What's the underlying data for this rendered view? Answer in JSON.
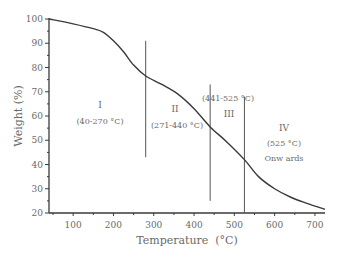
{
  "chart_data": {
    "type": "line",
    "title": "",
    "xlabel": "Temperature  (°C)",
    "ylabel": "Weight (%)",
    "xlim": [
      40,
      725
    ],
    "ylim": [
      20,
      100
    ],
    "xticks": [
      100,
      200,
      300,
      400,
      500,
      600,
      700
    ],
    "yticks": [
      20,
      30,
      40,
      50,
      60,
      70,
      80,
      90,
      100
    ],
    "grid": false,
    "legend": null,
    "series": [
      {
        "name": "TGA curve",
        "x": [
          40,
          100,
          150,
          175,
          200,
          225,
          250,
          280,
          320,
          360,
          400,
          440,
          480,
          525,
          560,
          600,
          640,
          680,
          725
        ],
        "y": [
          100,
          98,
          96,
          94.5,
          91,
          86.5,
          81,
          76.5,
          73,
          69,
          63,
          55.5,
          49.5,
          42,
          35,
          30,
          26.5,
          24,
          21.5
        ]
      }
    ],
    "vlines": [
      {
        "x": 280,
        "y_top": 91,
        "y_bottom": 43
      },
      {
        "x": 440,
        "y_top": 73,
        "y_bottom": 25
      },
      {
        "x": 525,
        "y_top": 68,
        "y_bottom": 20
      }
    ],
    "annotations": [
      {
        "id": "stage1",
        "lines": [
          "I",
          "(40-270 °C)"
        ]
      },
      {
        "id": "stage2",
        "lines": [
          "II",
          "(271-440 °C)"
        ]
      },
      {
        "id": "stage3",
        "lines": [
          "(441-525 °C)",
          "III"
        ]
      },
      {
        "id": "stage4",
        "lines": [
          "IV",
          "(525 °C)",
          "Onw ards"
        ]
      }
    ]
  }
}
